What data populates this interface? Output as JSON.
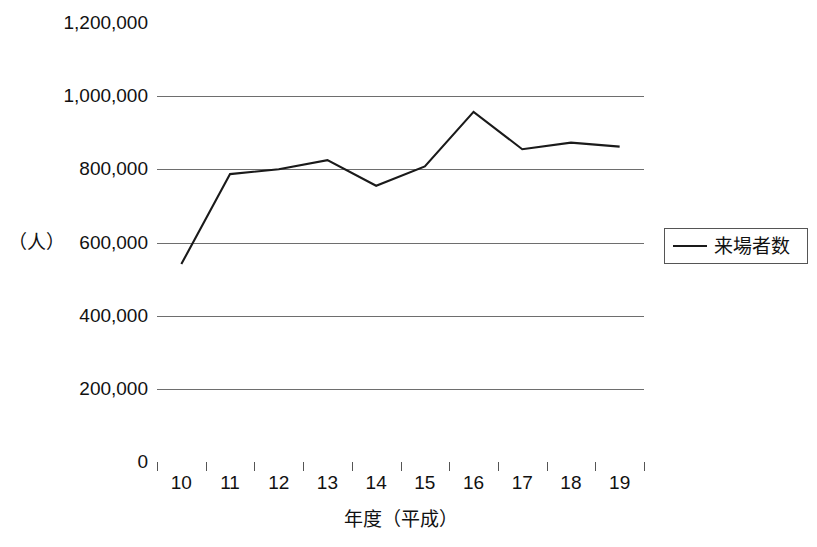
{
  "chart_data": {
    "type": "line",
    "title": "",
    "xlabel": "年度（平成）",
    "ylabel": "（人）",
    "unit_label": "（人）",
    "categories": [
      "10",
      "11",
      "12",
      "13",
      "14",
      "15",
      "16",
      "17",
      "18",
      "19"
    ],
    "series": [
      {
        "name": "来場者数",
        "values": [
          541000,
          787000,
          800000,
          825000,
          755000,
          808000,
          957000,
          855000,
          873000,
          862000
        ]
      }
    ],
    "ylim": [
      0,
      1200000
    ],
    "ytick_values": [
      1200000,
      1000000,
      800000,
      600000,
      400000,
      200000,
      0
    ],
    "ytick_labels": [
      "1,200,000",
      "1,000,000",
      "800,000",
      "600,000",
      "400,000",
      "200,000",
      "0"
    ],
    "grid": true,
    "grid_axis": "y",
    "legend_position": "right",
    "line_color": "#1a1a1a",
    "axis_color": "#555555",
    "grid_color": "#6e6e6e",
    "background_color": "#ffffff",
    "markers": false
  },
  "legend": {
    "entries": [
      {
        "label": "来場者数",
        "color": "#1a1a1a"
      }
    ]
  },
  "axes": {
    "y_unit": "（人）",
    "x_title": "年度（平成）"
  }
}
